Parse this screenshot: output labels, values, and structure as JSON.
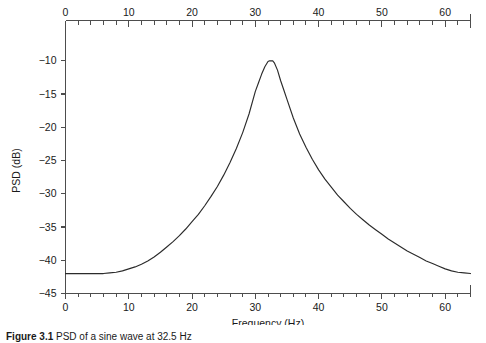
{
  "figure": {
    "caption_label": "Figure 3.1",
    "caption_text": "PSD of a sine wave at 32.5 Hz"
  },
  "chart_data": {
    "type": "line",
    "title": "",
    "xlabel": "Frequency (Hz)",
    "ylabel": "PSD (dB)",
    "xlim": [
      0,
      64
    ],
    "ylim": [
      -45,
      -8
    ],
    "grid": false,
    "legend": null,
    "x_ticks_top": [
      0,
      10,
      20,
      30,
      40,
      50,
      60
    ],
    "x_tick_labels_top": [
      "0",
      "10",
      "20",
      "30",
      "40",
      "50",
      "60"
    ],
    "x_ticks_bottom": [
      0,
      10,
      20,
      30,
      40,
      50,
      60
    ],
    "x_tick_labels_bottom": [
      "0",
      "10",
      "20",
      "30",
      "40",
      "50",
      "60"
    ],
    "x_minor_tick_step": 2,
    "y_ticks": [
      -10,
      -15,
      -20,
      -25,
      -30,
      -35,
      -40,
      -45
    ],
    "y_tick_labels": [
      "−10",
      "−15",
      "−20",
      "−25",
      "−30",
      "−35",
      "−40",
      "−45"
    ],
    "peak_frequency_hz": 32.5,
    "peak_value_db": -10,
    "noise_floor_db": -42,
    "series": [
      {
        "name": "PSD",
        "color": "#2b2b2b",
        "x": [
          0,
          1,
          2,
          3,
          4,
          5,
          6,
          7,
          8,
          9,
          10,
          11,
          12,
          13,
          14,
          15,
          16,
          17,
          18,
          19,
          20,
          21,
          22,
          23,
          24,
          25,
          26,
          27,
          28,
          29,
          30,
          30.5,
          31,
          31.5,
          32,
          32.25,
          32.5,
          32.75,
          33,
          33.5,
          34,
          34.5,
          35,
          36,
          37,
          38,
          39,
          40,
          41,
          42,
          43,
          44,
          45,
          46,
          47,
          48,
          49,
          50,
          51,
          52,
          53,
          54,
          55,
          56,
          57,
          58,
          59,
          60,
          61,
          62,
          63,
          64
        ],
        "y": [
          -42.0,
          -42.0,
          -42.0,
          -42.0,
          -42.0,
          -42.0,
          -42.0,
          -41.9,
          -41.8,
          -41.6,
          -41.3,
          -41.0,
          -40.6,
          -40.1,
          -39.5,
          -38.8,
          -38.0,
          -37.2,
          -36.3,
          -35.3,
          -34.2,
          -33.1,
          -31.8,
          -30.4,
          -28.9,
          -27.2,
          -25.3,
          -23.2,
          -20.8,
          -18.0,
          -14.6,
          -13.3,
          -12.0,
          -10.9,
          -10.1,
          -10.0,
          -10.0,
          -10.0,
          -10.3,
          -11.4,
          -13.0,
          -14.4,
          -15.8,
          -18.6,
          -21.0,
          -23.0,
          -24.8,
          -26.4,
          -27.8,
          -29.0,
          -30.2,
          -31.2,
          -32.2,
          -33.1,
          -33.9,
          -34.7,
          -35.4,
          -36.1,
          -36.8,
          -37.4,
          -38.0,
          -38.6,
          -39.1,
          -39.6,
          -40.1,
          -40.5,
          -40.9,
          -41.3,
          -41.6,
          -41.8,
          -41.9,
          -42.0
        ]
      }
    ]
  }
}
